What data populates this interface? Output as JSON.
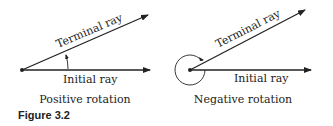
{
  "figure": {
    "caption": "Figure 3.2",
    "panels": [
      {
        "title": "Positive rotation",
        "terminal_label": "Terminal ray",
        "initial_label": "Initial ray",
        "rotation_marker": "short arc arrow counterclockwise"
      },
      {
        "title": "Negative rotation",
        "terminal_label": "Terminal ray",
        "initial_label": "Initial ray",
        "rotation_marker": "near-full circle arrow clockwise"
      }
    ]
  },
  "colors": {
    "ink": "#222222",
    "background": "#ffffff"
  }
}
